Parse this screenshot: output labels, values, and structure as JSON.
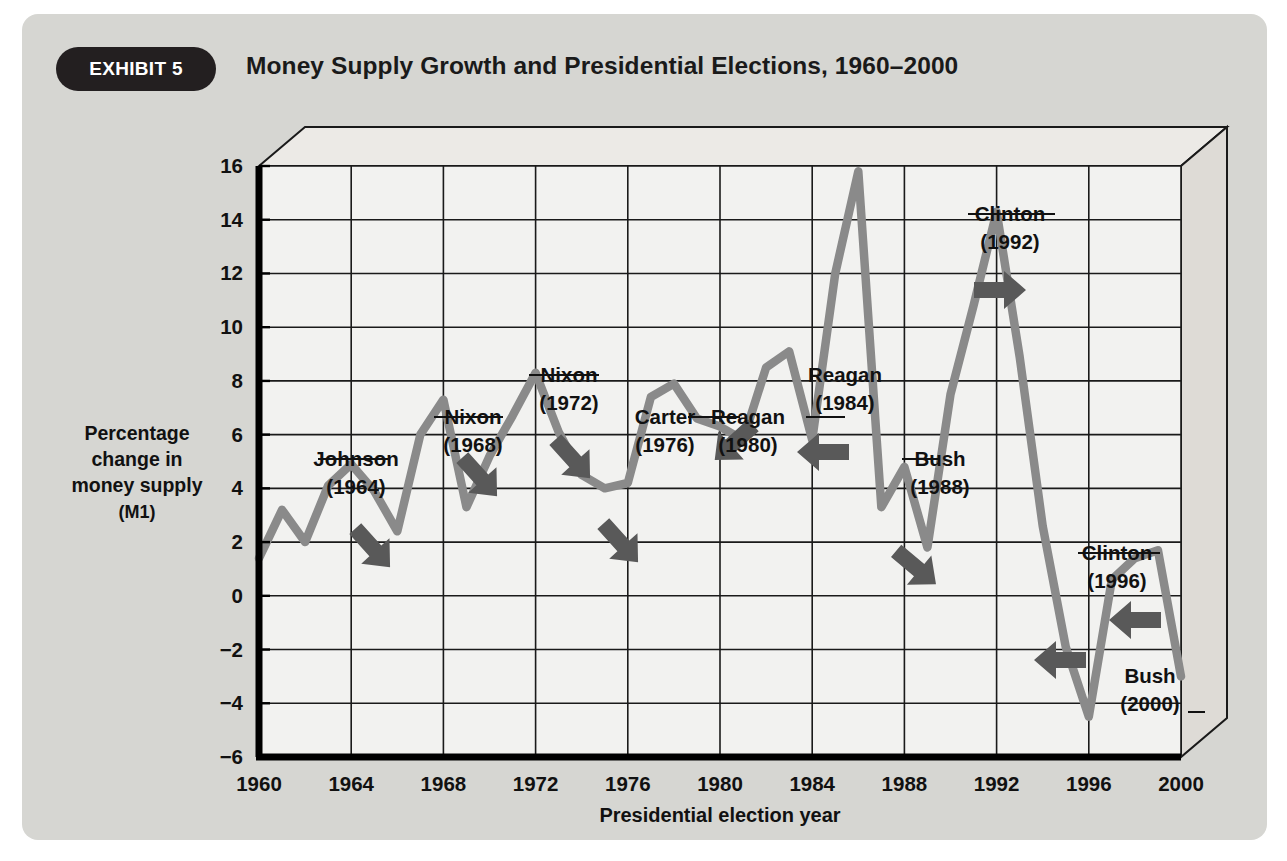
{
  "header": {
    "exhibit_label": "EXHIBIT 5",
    "title": "Money Supply Growth and Presidential Elections, 1960–2000"
  },
  "colors": {
    "card_background": "#d6d6d2",
    "page_background": "#ffffff",
    "pill_background": "#231f20",
    "pill_text": "#ffffff",
    "plot_background": "#f2f2f0",
    "grid": "#1a1a1a",
    "axis": "#000000",
    "series_line": "#8a8a8a",
    "arrow": "#595959",
    "text": "#111111"
  },
  "chart_data": {
    "type": "line",
    "title": "Money Supply Growth and Presidential Elections, 1960–2000",
    "xlabel": "Presidential election year",
    "ylabel": "Percentage change in money supply (M1)",
    "ylabel_lines": [
      "Percentage",
      "change in",
      "money supply",
      "(M1)"
    ],
    "xlim": [
      1960,
      2000
    ],
    "ylim": [
      -6,
      16
    ],
    "ytick_step": 2,
    "xtick_step": 4,
    "grid": true,
    "legend": "none",
    "xticks": [
      1960,
      1964,
      1968,
      1972,
      1976,
      1980,
      1984,
      1988,
      1992,
      1996,
      2000
    ],
    "yticks": [
      16,
      14,
      12,
      10,
      8,
      6,
      4,
      2,
      0,
      -2,
      -4,
      -6
    ],
    "series": [
      {
        "name": "Percentage change in money supply (M1)",
        "x": [
          1960,
          1961,
          1962,
          1963,
          1964,
          1965,
          1966,
          1967,
          1968,
          1969,
          1970,
          1971,
          1972,
          1973,
          1974,
          1975,
          1976,
          1977,
          1978,
          1979,
          1980,
          1981,
          1982,
          1983,
          1984,
          1985,
          1986,
          1987,
          1988,
          1989,
          1990,
          1991,
          1992,
          1993,
          1994,
          1995,
          1996,
          1997,
          1998,
          1999,
          2000
        ],
        "values": [
          1.4,
          3.2,
          2.0,
          4.1,
          4.9,
          3.9,
          2.4,
          6.0,
          7.3,
          3.3,
          5.2,
          6.7,
          8.3,
          6.1,
          4.5,
          4.0,
          4.2,
          7.4,
          7.9,
          6.6,
          6.3,
          5.8,
          8.5,
          9.1,
          5.8,
          12.0,
          15.8,
          3.3,
          4.8,
          1.8,
          7.5,
          10.8,
          14.3,
          8.9,
          2.6,
          -1.9,
          -4.5,
          0.6,
          1.4,
          1.7,
          -3.0
        ],
        "color": "#8a8a8a"
      }
    ],
    "annotations": [
      {
        "label": "Johnson",
        "year_text": "(1964)",
        "year": 1964,
        "arrow": "up-right"
      },
      {
        "label": "Nixon",
        "year_text": "(1968)",
        "year": 1968,
        "arrow": "up-right"
      },
      {
        "label": "Nixon",
        "year_text": "(1972)",
        "year": 1972,
        "arrow": "up-right"
      },
      {
        "label": "Carter",
        "year_text": "(1976)",
        "year": 1976,
        "arrow": "up-right"
      },
      {
        "label": "Reagan",
        "year_text": "(1980)",
        "year": 1980,
        "arrow": "down-right"
      },
      {
        "label": "Reagan",
        "year_text": "(1984)",
        "year": 1984,
        "arrow": "down"
      },
      {
        "label": "Bush",
        "year_text": "(1988)",
        "year": 1988,
        "arrow": "up-right"
      },
      {
        "label": "Clinton",
        "year_text": "(1992)",
        "year": 1992,
        "arrow": "up"
      },
      {
        "label": "Clinton",
        "year_text": "(1996)",
        "year": 1996,
        "arrow": "down-right"
      },
      {
        "label": "Bush",
        "year_text": "(2000)",
        "year": 2000,
        "arrow": "down"
      }
    ]
  }
}
